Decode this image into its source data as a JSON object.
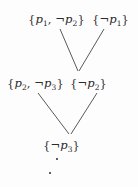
{
  "diagram": {
    "type": "resolution-refutation-tree",
    "background_color": "#fdfdfd",
    "text_color": "#2a2a2a",
    "edge_color": "#5a5a5a",
    "nodes": [
      {
        "id": "top-left",
        "text": "{p1, ¬p2}",
        "open_brace": "{",
        "close_brace": "}",
        "literals": [
          {
            "negated": false,
            "symbol": "p",
            "subscript": "1"
          },
          {
            "negated": true,
            "symbol": "p",
            "subscript": "2"
          }
        ],
        "separator": ", ",
        "row": "top",
        "column": "left"
      },
      {
        "id": "top-right",
        "text": "{¬p1}",
        "open_brace": "{",
        "close_brace": "}",
        "literals": [
          {
            "negated": true,
            "symbol": "p",
            "subscript": "1"
          }
        ],
        "separator": "",
        "row": "top",
        "column": "right"
      },
      {
        "id": "mid-left",
        "text": "{p2, ¬p3}",
        "open_brace": "{",
        "close_brace": "}",
        "literals": [
          {
            "negated": false,
            "symbol": "p",
            "subscript": "2"
          },
          {
            "negated": true,
            "symbol": "p",
            "subscript": "3"
          }
        ],
        "separator": ", ",
        "row": "middle",
        "column": "left"
      },
      {
        "id": "mid-right",
        "text": "{¬p2}",
        "open_brace": "{",
        "close_brace": "}",
        "literals": [
          {
            "negated": true,
            "symbol": "p",
            "subscript": "2"
          }
        ],
        "separator": "",
        "row": "middle",
        "column": "right"
      },
      {
        "id": "bottom",
        "text": "{¬p3}",
        "open_brace": "{",
        "close_brace": "}",
        "literals": [
          {
            "negated": true,
            "symbol": "p",
            "subscript": "3"
          }
        ],
        "separator": "",
        "row": "bottom",
        "column": "center"
      }
    ],
    "edges": [
      {
        "id": "edge-topleft-to-midright",
        "from": "top-left",
        "to": "mid-right",
        "x1": 60,
        "y1": 29,
        "x2": 78,
        "y2": 71
      },
      {
        "id": "edge-topright-to-midright",
        "from": "top-right",
        "to": "mid-right",
        "x1": 104,
        "y1": 29,
        "x2": 79,
        "y2": 71
      },
      {
        "id": "edge-midleft-to-bottom",
        "from": "mid-left",
        "to": "bottom",
        "x1": 38,
        "y1": 93,
        "x2": 69,
        "y2": 134
      },
      {
        "id": "edge-midright-to-bottom",
        "from": "mid-right",
        "to": "bottom",
        "x1": 97,
        "y1": 93,
        "x2": 71,
        "y2": 134
      }
    ],
    "vertical_dots": {
      "name": "vertical-ellipsis",
      "count": 2,
      "dots": [
        {
          "x": 56,
          "y": 158
        },
        {
          "x": 49,
          "y": 172
        }
      ]
    }
  }
}
